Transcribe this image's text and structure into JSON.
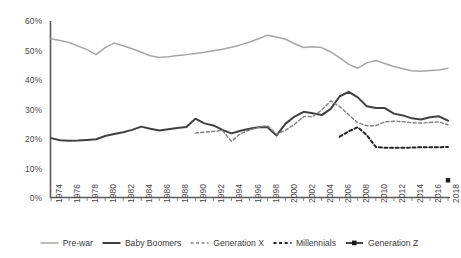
{
  "chart_data": {
    "type": "line",
    "title": "",
    "xlabel": "",
    "ylabel": "",
    "ylim": [
      0,
      60
    ],
    "yticks": [
      0,
      10,
      20,
      30,
      40,
      50,
      60
    ],
    "ytick_labels": [
      "0%",
      "10%",
      "20%",
      "30%",
      "40%",
      "50%",
      "60%"
    ],
    "grid": false,
    "legend_position": "bottom",
    "x": [
      1974,
      1975,
      1976,
      1977,
      1978,
      1979,
      1980,
      1981,
      1982,
      1983,
      1984,
      1985,
      1986,
      1987,
      1988,
      1989,
      1990,
      1991,
      1992,
      1993,
      1994,
      1995,
      1996,
      1997,
      1998,
      1999,
      2000,
      2001,
      2002,
      2003,
      2004,
      2005,
      2006,
      2007,
      2008,
      2009,
      2010,
      2011,
      2012,
      2013,
      2014,
      2015,
      2016,
      2017,
      2018
    ],
    "xtick_labels": [
      "1974",
      "1976",
      "1978",
      "1980",
      "1982",
      "1984",
      "1986",
      "1988",
      "1990",
      "1992",
      "1994",
      "1996",
      "1998",
      "2000",
      "2002",
      "2004",
      "2006",
      "2008",
      "2010",
      "2012",
      "2014",
      "2016",
      "2018"
    ],
    "series": [
      {
        "name": "Pre-war",
        "color": "#a6a6a6",
        "style": "solid",
        "width": 1.5,
        "values": [
          54.0,
          53.4,
          52.7,
          51.5,
          50.3,
          48.6,
          51.0,
          52.5,
          51.6,
          50.6,
          49.4,
          48.2,
          47.6,
          47.9,
          48.3,
          48.6,
          49.0,
          49.4,
          49.9,
          50.4,
          51.1,
          51.9,
          52.9,
          54.0,
          55.2,
          54.6,
          53.8,
          52.3,
          51.0,
          51.3,
          51.0,
          49.5,
          47.5,
          45.3,
          44.0,
          45.8,
          46.6,
          45.6,
          44.6,
          43.8,
          43.1,
          43.0,
          43.2,
          43.4,
          44.0
        ]
      },
      {
        "name": "Baby Boomers",
        "color": "#404040",
        "style": "solid",
        "width": 2.0,
        "values": [
          20.3,
          19.6,
          19.4,
          19.5,
          19.7,
          19.9,
          21.0,
          21.7,
          22.3,
          23.1,
          24.2,
          23.5,
          22.9,
          23.3,
          23.7,
          24.1,
          26.9,
          25.3,
          24.6,
          23.1,
          21.9,
          22.8,
          23.5,
          24.0,
          24.0,
          21.2,
          25.2,
          27.6,
          29.2,
          28.7,
          28.1,
          30.2,
          34.5,
          36.0,
          34.1,
          31.1,
          30.5,
          30.5,
          28.6,
          28.0,
          27.0,
          26.6,
          27.4,
          27.7,
          26.2
        ]
      },
      {
        "name": "Generation X",
        "color": "#808080",
        "style": "dashed",
        "width": 1.4,
        "start_index": 16,
        "values": [
          null,
          null,
          null,
          null,
          null,
          null,
          null,
          null,
          null,
          null,
          null,
          null,
          null,
          null,
          null,
          null,
          22.0,
          22.3,
          22.6,
          22.9,
          19.2,
          21.8,
          23.0,
          24.0,
          24.5,
          21.6,
          23.0,
          25.0,
          27.6,
          27.6,
          29.8,
          32.9,
          31.0,
          28.2,
          25.5,
          24.5,
          24.5,
          25.8,
          26.0,
          25.9,
          25.5,
          25.4,
          25.6,
          25.8,
          24.8
        ]
      },
      {
        "name": "Millennials",
        "color": "#262626",
        "style": "dotted",
        "width": 2.0,
        "start_index": 32,
        "values": [
          null,
          null,
          null,
          null,
          null,
          null,
          null,
          null,
          null,
          null,
          null,
          null,
          null,
          null,
          null,
          null,
          null,
          null,
          null,
          null,
          null,
          null,
          null,
          null,
          null,
          null,
          null,
          null,
          null,
          null,
          null,
          null,
          20.8,
          22.6,
          24.0,
          21.3,
          17.3,
          17.0,
          17.0,
          17.0,
          17.1,
          17.2,
          17.2,
          17.2,
          17.3
        ]
      },
      {
        "name": "Generation Z",
        "color": "#1a1a1a",
        "style": "marker",
        "width": 2.0,
        "start_index": 44,
        "values": [
          null,
          null,
          null,
          null,
          null,
          null,
          null,
          null,
          null,
          null,
          null,
          null,
          null,
          null,
          null,
          null,
          null,
          null,
          null,
          null,
          null,
          null,
          null,
          null,
          null,
          null,
          null,
          null,
          null,
          null,
          null,
          null,
          null,
          null,
          null,
          null,
          null,
          null,
          null,
          null,
          null,
          null,
          null,
          null,
          6.0
        ]
      }
    ]
  },
  "axis": {
    "y_axis_name": "y-axis",
    "x_axis_name": "x-axis"
  }
}
